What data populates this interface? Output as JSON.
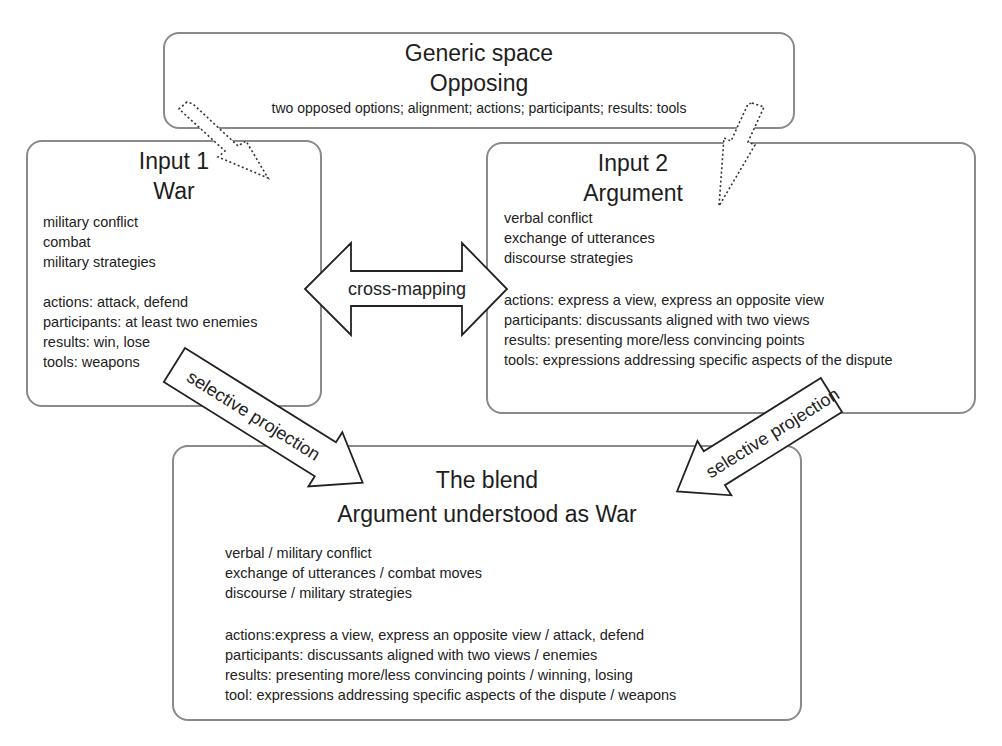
{
  "generic": {
    "title": "Generic space",
    "subtitle": "Opposing",
    "text": "two opposed options; alignment; actions; participants; results: tools"
  },
  "input1": {
    "title": "Input 1",
    "subtitle": "War",
    "group1": [
      "military conflict",
      "combat",
      "military strategies"
    ],
    "group2": [
      "actions: attack, defend",
      "participants: at least two enemies",
      "results: win, lose",
      "tools: weapons"
    ]
  },
  "input2": {
    "title": "Input 2",
    "subtitle": "Argument",
    "group1": [
      "verbal conflict",
      "exchange of utterances",
      "discourse strategies"
    ],
    "group2": [
      "actions: express a view, express an opposite view",
      "participants: discussants aligned with two views",
      "results: presenting more/less convincing points",
      "tools: expressions addressing specific aspects of the dispute"
    ]
  },
  "blend": {
    "title": "The blend",
    "subtitle": "Argument understood as War",
    "group1": [
      "verbal / military conflict",
      "exchange of utterances / combat moves",
      "discourse / military strategies"
    ],
    "group2": [
      "actions:express a view, express an opposite view / attack, defend",
      "participants: discussants aligned with two views / enemies",
      "results: presenting more/less convincing points / winning, losing",
      "tool: expressions addressing specific aspects of the dispute / weapons"
    ]
  },
  "arrows": {
    "cross_mapping": "cross-mapping",
    "projection_left": "selective projection",
    "projection_right": "selective projection"
  },
  "colors": {
    "border": "#8a8a8a",
    "arrow_stroke": "#222222",
    "text": "#222222"
  }
}
